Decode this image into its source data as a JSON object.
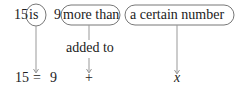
{
  "top_row": {
    "n15": "15",
    "is": "is",
    "n9": "9",
    "more_than": "more than",
    "a_certain_number": "a certain number"
  },
  "middle": {
    "added_to": "added to"
  },
  "bottom_row": {
    "n15": "15",
    "equals": "=",
    "n9": "9",
    "plus": "+",
    "x": "x"
  },
  "colors": {
    "line": "#888888",
    "text": "#222222"
  }
}
